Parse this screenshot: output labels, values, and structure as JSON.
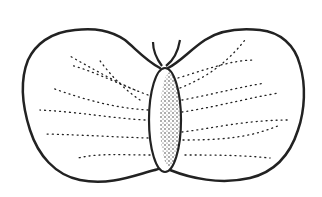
{
  "figure": {
    "subject": "butterfly line drawing",
    "stroke_color": "#222222",
    "background": "#ffffff"
  }
}
